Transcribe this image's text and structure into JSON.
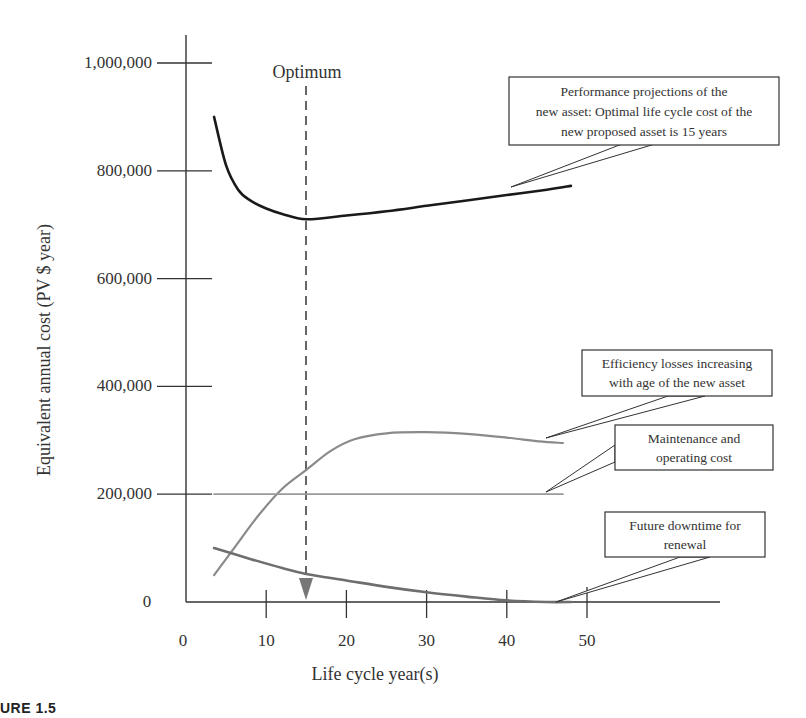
{
  "figure_label": "URE 1.5",
  "chart_data": {
    "type": "line",
    "title": "",
    "xlabel": "Life cycle year(s)",
    "ylabel": "Equivalent annual cost (PV $ year)",
    "xlim": [
      0,
      68
    ],
    "ylim": [
      0,
      1050000
    ],
    "x_ticks": [
      0,
      10,
      20,
      30,
      40,
      50
    ],
    "x_tick_labels": [
      "0",
      "10",
      "20",
      "30",
      "40",
      "50"
    ],
    "y_ticks": [
      0,
      200000,
      400000,
      600000,
      800000,
      1000000
    ],
    "y_tick_labels": [
      "0",
      "200,000",
      "400,000",
      "600,000",
      "800,000",
      "1,000,000"
    ],
    "grid": false,
    "legend": "callout boxes",
    "optimum": {
      "label": "Optimum",
      "x": 15
    },
    "series": [
      {
        "name": "Performance projections of the new asset (total)",
        "color": "#1a1a1a",
        "x": [
          3.5,
          5,
          6.5,
          8,
          10,
          12,
          15,
          20,
          25,
          30,
          35,
          40,
          45,
          48
        ],
        "values": [
          900000,
          810000,
          765000,
          745000,
          730000,
          720000,
          710000,
          717000,
          725000,
          735000,
          745000,
          755000,
          765000,
          772000
        ]
      },
      {
        "name": "Efficiency losses increasing with age of the new asset",
        "color": "#8a8a8a",
        "x": [
          3.5,
          6,
          9,
          12,
          15,
          18,
          21,
          25,
          30,
          35,
          40,
          44,
          47
        ],
        "values": [
          50000,
          100000,
          160000,
          210000,
          245000,
          280000,
          302000,
          313000,
          315000,
          312000,
          305000,
          298000,
          295000
        ]
      },
      {
        "name": "Maintenance and operating cost",
        "color": "#9a9a9a",
        "x": [
          3.5,
          47
        ],
        "values": [
          200000,
          200000
        ]
      },
      {
        "name": "Future downtime for renewal",
        "color": "#6e6e6e",
        "x": [
          3.5,
          8,
          12,
          15,
          20,
          25,
          30,
          35,
          40,
          45,
          48
        ],
        "values": [
          100000,
          80000,
          63000,
          52000,
          40000,
          28000,
          18000,
          10000,
          3000,
          0,
          0
        ]
      }
    ],
    "annotations": [
      {
        "text_lines": [
          "Performance projections of the",
          "new asset: Optimal life cycle cost of the",
          "new proposed asset is 15 years"
        ],
        "points_to": "total"
      },
      {
        "text_lines": [
          "Efficiency losses increasing",
          "with age of the new asset"
        ],
        "points_to": "efficiency"
      },
      {
        "text_lines": [
          "Maintenance and",
          "operating cost"
        ],
        "points_to": "maintenance"
      },
      {
        "text_lines": [
          "Future downtime for",
          "renewal"
        ],
        "points_to": "downtime"
      }
    ]
  }
}
